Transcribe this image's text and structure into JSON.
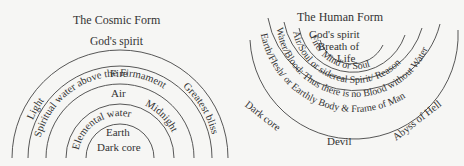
{
  "cosmic": {
    "title": "The Cosmic Form",
    "labels": {
      "gods_spirit": "God's spirit",
      "light": "Light",
      "spiritual_water": "Spiritual water above the Firmament",
      "greatest_bliss": "Greatest bliss",
      "fire": "Fire",
      "air": "Air",
      "midnight": "Midnight",
      "elemental_water": "Elemental water",
      "earth": "Earth",
      "dark_core": "Dark core"
    }
  },
  "human": {
    "title": "The Human Form",
    "labels": {
      "gods_spirit": "God's spirit",
      "breath_of": "Breath of",
      "life": "Life",
      "fire_mind": "Fire/ Mind or Soul",
      "air_soul": "Air/Soul or sidereal Spirit/ Reason",
      "water_blood": "Water/Blood: Thus there is no Blood without Water",
      "earth_flesh": "Earth/Flesh/ or Earthly Body & Frame of Man",
      "dark_core": "Dark core",
      "abyss": "Abyss of Hell",
      "devil": "Devil"
    }
  }
}
